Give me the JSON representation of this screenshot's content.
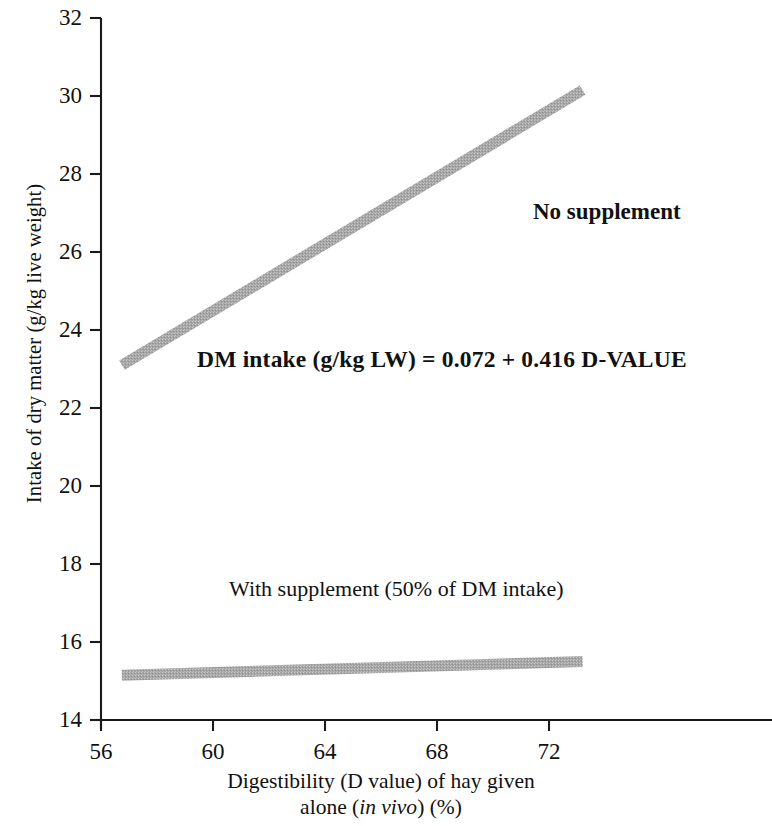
{
  "chart_data": {
    "type": "line",
    "title": "",
    "xlabel": "Digestibility (D value) of hay given alone (in vivo) (%)",
    "xlabel_line1": "Digestibility (D value) of hay given",
    "xlabel_line2_pre": "alone (",
    "xlabel_line2_italic": "in vivo",
    "xlabel_line2_post": ") (%)",
    "ylabel": "Intake of dry matter (g/kg live weight)",
    "xlim": [
      56,
      73.4
    ],
    "ylim": [
      14,
      32
    ],
    "xticks": [
      56,
      60,
      64,
      68,
      72
    ],
    "yticks": [
      14,
      16,
      18,
      20,
      22,
      24,
      26,
      28,
      30,
      32
    ],
    "grid": false,
    "legend_position": "inline-annotations",
    "line_color": "#a6a6a6",
    "axis_color": "#1a1a1a",
    "series": [
      {
        "name": "No supplement",
        "x": [
          56.75,
          73.2
        ],
        "y": [
          23.1,
          30.15
        ]
      },
      {
        "name": "With supplement (50% of DM intake)",
        "x": [
          56.75,
          73.2
        ],
        "y": [
          15.15,
          15.5
        ]
      }
    ],
    "annotations": [
      {
        "id": "no-supplement",
        "text": "No supplement",
        "x": 71.4,
        "y": 26.9
      },
      {
        "id": "equation",
        "text": "DM intake (g/kg LW) = 0.072 + 0.416 D-VALUE",
        "x": 59.4,
        "y": 23.0
      },
      {
        "id": "with-supplement",
        "text": "With supplement (50% of DM intake)",
        "x": 60.6,
        "y": 17.1
      }
    ]
  },
  "axes": {
    "y": {
      "title": "Intake of dry matter (g/kg live weight)",
      "ticks": [
        {
          "label": "32"
        },
        {
          "label": "30"
        },
        {
          "label": "28"
        },
        {
          "label": "26"
        },
        {
          "label": "24"
        },
        {
          "label": "22"
        },
        {
          "label": "20"
        },
        {
          "label": "18"
        },
        {
          "label": "16"
        },
        {
          "label": "14"
        }
      ]
    },
    "x": {
      "title_line1": "Digestibility (D value) of hay given",
      "title_line2_pre": "alone (",
      "title_line2_italic": "in vivo",
      "title_line2_post": ") (%)",
      "ticks": [
        {
          "label": "56"
        },
        {
          "label": "60"
        },
        {
          "label": "64"
        },
        {
          "label": "68"
        },
        {
          "label": "72"
        }
      ]
    }
  },
  "labels": {
    "no_supplement": "No supplement",
    "equation": "DM intake (g/kg LW) = 0.072 + 0.416 D-VALUE",
    "with_supplement": "With supplement (50% of DM intake)"
  }
}
